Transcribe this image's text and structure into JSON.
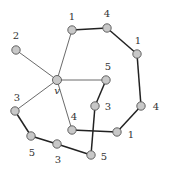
{
  "diagram": {
    "type": "graph",
    "center_label": "v",
    "nodes": [
      {
        "id": "v",
        "label": "v"
      },
      {
        "id": "a",
        "label": "2"
      },
      {
        "id": "b",
        "label": "1"
      },
      {
        "id": "c",
        "label": "4"
      },
      {
        "id": "d",
        "label": "1"
      },
      {
        "id": "e",
        "label": "5"
      },
      {
        "id": "f",
        "label": "3"
      },
      {
        "id": "g",
        "label": "4"
      },
      {
        "id": "h",
        "label": "1"
      },
      {
        "id": "i",
        "label": "4"
      },
      {
        "id": "j",
        "label": "3"
      },
      {
        "id": "k",
        "label": "5"
      },
      {
        "id": "l",
        "label": "3"
      },
      {
        "id": "m",
        "label": "5"
      }
    ],
    "edges": [
      {
        "from": "v",
        "to": "a",
        "style": "thin"
      },
      {
        "from": "v",
        "to": "b",
        "style": "thin"
      },
      {
        "from": "v",
        "to": "e",
        "style": "thin"
      },
      {
        "from": "v",
        "to": "j",
        "style": "thin"
      },
      {
        "from": "v",
        "to": "i",
        "style": "thin"
      },
      {
        "from": "b",
        "to": "c",
        "style": "thick"
      },
      {
        "from": "c",
        "to": "d",
        "style": "thick"
      },
      {
        "from": "d",
        "to": "g",
        "style": "thick"
      },
      {
        "from": "g",
        "to": "h",
        "style": "thick"
      },
      {
        "from": "h",
        "to": "i",
        "style": "thick"
      },
      {
        "from": "e",
        "to": "f",
        "style": "thick"
      },
      {
        "from": "f",
        "to": "m",
        "style": "thick"
      },
      {
        "from": "j",
        "to": "k",
        "style": "thick"
      },
      {
        "from": "k",
        "to": "l",
        "style": "thick"
      },
      {
        "from": "l",
        "to": "m",
        "style": "thick"
      }
    ]
  }
}
